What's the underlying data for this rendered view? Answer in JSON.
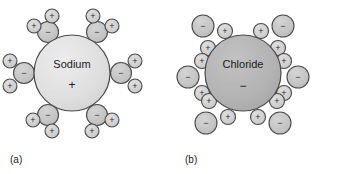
{
  "figure": {
    "width": 341,
    "height": 174,
    "background_color": "#ffffff"
  },
  "colors": {
    "sodium_ion_fill": "#dedede",
    "chloride_ion_fill": "#b2b2b2",
    "oxygen_fill": "#c4c4c4",
    "hydrogen_fill": "#cfcfcf",
    "outline": "#4a4a4a",
    "text": "#1a1a1a",
    "caption_text": "#222222"
  },
  "panels": [
    {
      "id": "panel-a",
      "caption": "(a)",
      "caption_x": 10,
      "caption_y": 160,
      "ion": {
        "name": "Sodium",
        "charge": "+",
        "cx": 72,
        "cy": 73,
        "r": 38,
        "fill": "#dedede",
        "label_dy": -8,
        "charge_dy": 13
      },
      "water_orientation": "oxygen-inward",
      "waters": [
        {
          "angle_deg": -120,
          "oxygen": {
            "cx": 48,
            "cy": 32,
            "r": 10.5,
            "charge": "−"
          },
          "hydrogens": [
            {
              "cx": 34,
              "cy": 26,
              "r": 7,
              "charge": "+"
            },
            {
              "cx": 52,
              "cy": 16,
              "r": 7,
              "charge": "+"
            }
          ]
        },
        {
          "angle_deg": -60,
          "oxygen": {
            "cx": 97,
            "cy": 32,
            "r": 10.5,
            "charge": "−"
          },
          "hydrogens": [
            {
              "cx": 93,
              "cy": 16,
              "r": 7,
              "charge": "+"
            },
            {
              "cx": 112,
              "cy": 26,
              "r": 7,
              "charge": "+"
            }
          ]
        },
        {
          "angle_deg": 180,
          "oxygen": {
            "cx": 24,
            "cy": 73,
            "r": 10.5,
            "charge": "−"
          },
          "hydrogens": [
            {
              "cx": 10,
              "cy": 61,
              "r": 7,
              "charge": "+"
            },
            {
              "cx": 10,
              "cy": 86,
              "r": 7,
              "charge": "+"
            }
          ]
        },
        {
          "angle_deg": 0,
          "oxygen": {
            "cx": 121,
            "cy": 73,
            "r": 10.5,
            "charge": "−"
          },
          "hydrogens": [
            {
              "cx": 135,
              "cy": 61,
              "r": 7,
              "charge": "+"
            },
            {
              "cx": 135,
              "cy": 86,
              "r": 7,
              "charge": "+"
            }
          ]
        },
        {
          "angle_deg": 120,
          "oxygen": {
            "cx": 48,
            "cy": 115,
            "r": 10.5,
            "charge": "−"
          },
          "hydrogens": [
            {
              "cx": 33,
              "cy": 120,
              "r": 7,
              "charge": "+"
            },
            {
              "cx": 52,
              "cy": 131,
              "r": 7,
              "charge": "+"
            }
          ]
        },
        {
          "angle_deg": 60,
          "oxygen": {
            "cx": 97,
            "cy": 115,
            "r": 10.5,
            "charge": "−"
          },
          "hydrogens": [
            {
              "cx": 92,
              "cy": 131,
              "r": 7,
              "charge": "+"
            },
            {
              "cx": 112,
              "cy": 120,
              "r": 7,
              "charge": "+"
            }
          ]
        }
      ]
    },
    {
      "id": "panel-b",
      "caption": "(b)",
      "caption_x": 185,
      "caption_y": 160,
      "ion": {
        "name": "Chloride",
        "charge": "−",
        "cx": 243,
        "cy": 73,
        "r": 38,
        "fill": "#b2b2b2",
        "label_dy": -8,
        "charge_dy": 14
      },
      "water_orientation": "hydrogen-inward",
      "waters": [
        {
          "angle_deg": -120,
          "oxygen": {
            "cx": 203,
            "cy": 26,
            "r": 11,
            "charge": "−"
          },
          "hydrogens": [
            {
              "cx": 225,
              "cy": 31,
              "r": 7.5,
              "charge": "+"
            },
            {
              "cx": 208,
              "cy": 48,
              "r": 7.5,
              "charge": "+"
            }
          ]
        },
        {
          "angle_deg": -60,
          "oxygen": {
            "cx": 283,
            "cy": 26,
            "r": 11,
            "charge": "−"
          },
          "hydrogens": [
            {
              "cx": 261,
              "cy": 31,
              "r": 7.5,
              "charge": "+"
            },
            {
              "cx": 278,
              "cy": 48,
              "r": 7.5,
              "charge": "+"
            }
          ]
        },
        {
          "angle_deg": 180,
          "oxygen": {
            "cx": 188,
            "cy": 77,
            "r": 11,
            "charge": "−"
          },
          "hydrogens": [
            {
              "cx": 202,
              "cy": 61,
              "r": 7.5,
              "charge": "+"
            },
            {
              "cx": 202,
              "cy": 93,
              "r": 7.5,
              "charge": "+"
            }
          ]
        },
        {
          "angle_deg": 0,
          "oxygen": {
            "cx": 298,
            "cy": 77,
            "r": 11,
            "charge": "−"
          },
          "hydrogens": [
            {
              "cx": 284,
              "cy": 61,
              "r": 7.5,
              "charge": "+"
            },
            {
              "cx": 284,
              "cy": 93,
              "r": 7.5,
              "charge": "+"
            }
          ]
        },
        {
          "angle_deg": 120,
          "oxygen": {
            "cx": 206,
            "cy": 123,
            "r": 11,
            "charge": "−"
          },
          "hydrogens": [
            {
              "cx": 209,
              "cy": 101,
              "r": 7.5,
              "charge": "+"
            },
            {
              "cx": 228,
              "cy": 117,
              "r": 7.5,
              "charge": "+"
            }
          ]
        },
        {
          "angle_deg": 60,
          "oxygen": {
            "cx": 280,
            "cy": 123,
            "r": 11,
            "charge": "−"
          },
          "hydrogens": [
            {
              "cx": 277,
              "cy": 101,
              "r": 7.5,
              "charge": "+"
            },
            {
              "cx": 258,
              "cy": 117,
              "r": 7.5,
              "charge": "+"
            }
          ]
        }
      ]
    }
  ]
}
